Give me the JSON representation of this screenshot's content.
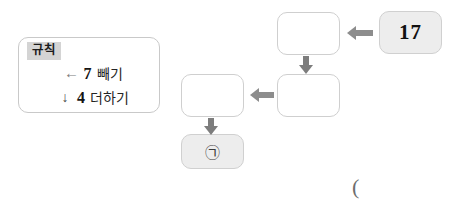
{
  "rule_card": {
    "title": "규칙",
    "rules": [
      {
        "arrow_icon": "arrow-left-icon",
        "arrow_glyph": "←",
        "number": "7",
        "operation": "빼기"
      },
      {
        "arrow_icon": "arrow-down-icon",
        "arrow_glyph": "↓",
        "number": "4",
        "operation": "더하기"
      }
    ]
  },
  "flow": {
    "boxes": [
      {
        "id": "start",
        "value": "17",
        "filled": true
      },
      {
        "id": "step1",
        "value": "",
        "filled": false
      },
      {
        "id": "step2",
        "value": "",
        "filled": false
      },
      {
        "id": "step3",
        "value": "",
        "filled": false
      },
      {
        "id": "answer",
        "value": "㉠",
        "filled": true
      }
    ],
    "arrows": [
      {
        "id": "a",
        "direction": "left",
        "icon": "arrow-left-icon"
      },
      {
        "id": "b",
        "direction": "down",
        "icon": "arrow-down-icon"
      },
      {
        "id": "c",
        "direction": "left",
        "icon": "arrow-left-icon"
      },
      {
        "id": "d",
        "direction": "down",
        "icon": "arrow-down-icon"
      }
    ]
  },
  "misc": {
    "stray_paren": "("
  },
  "colors": {
    "box_border": "#cfcfcf",
    "box_fill": "#ededed",
    "arrow": "#8d8d8d",
    "title_highlight": "#d4d4d4"
  }
}
